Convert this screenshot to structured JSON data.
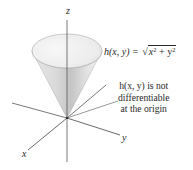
{
  "figure": {
    "axes": {
      "z_label": "z",
      "y_label": "y",
      "x_label": "x"
    },
    "surface": {
      "name": "cone",
      "function_lhs": "h(x, y) =",
      "function_rhs_radicand_parts": [
        "x",
        "2",
        " + y",
        "2"
      ]
    },
    "annotation": {
      "line1": "h(x, y) is not",
      "line2": "differentiable",
      "line3": "at the origin"
    },
    "colors": {
      "axis": "#555555",
      "cone_light": "#f2f2f2",
      "cone_mid": "#d4d4d4",
      "cone_dark": "#b8b8b8",
      "text": "#2a2a2a"
    }
  }
}
